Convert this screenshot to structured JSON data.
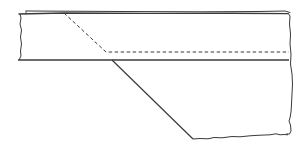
{
  "diagram": {
    "type": "technical-line-drawing",
    "colors": {
      "background": "#ffffff",
      "line": "#3a3a3a",
      "dashed_line": "#3a3a3a"
    },
    "elements": [
      {
        "id": "plate-top-edge",
        "style": "solid"
      },
      {
        "id": "plate-bottom-edge",
        "style": "solid"
      },
      {
        "id": "left-break-edge",
        "style": "solid-irregular"
      },
      {
        "id": "right-break-edge",
        "style": "solid-irregular"
      },
      {
        "id": "hidden-bevel-line",
        "style": "dashed"
      },
      {
        "id": "bevel-edge",
        "style": "solid"
      },
      {
        "id": "bottom-break-edge",
        "style": "solid-irregular"
      }
    ]
  }
}
